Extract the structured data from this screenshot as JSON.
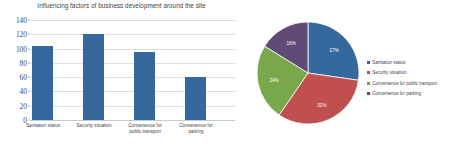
{
  "chart_data": [
    {
      "type": "bar",
      "title": "Influencing factors of business development around the site",
      "xlabel": "",
      "ylabel": "",
      "ylim": [
        0,
        140
      ],
      "yticks": [
        0,
        20,
        40,
        60,
        80,
        100,
        120,
        140
      ],
      "grid": true,
      "legend": "none",
      "categories": [
        "Sanitation status",
        "Security situation",
        "Convenience for public transport",
        "Convenience for parking"
      ],
      "values": [
        103,
        120,
        95,
        60
      ],
      "series_color": "#35699e"
    },
    {
      "type": "pie",
      "title": "",
      "legend": "right",
      "labels": [
        "Sanitation status",
        "Security situation",
        "Convenience for public transport",
        "Convenience for parking"
      ],
      "values": [
        27,
        32,
        24,
        16
      ],
      "value_labels": [
        "27%",
        "32%",
        "24%",
        "16%"
      ],
      "colors": [
        "#35699e",
        "#c0504d",
        "#79a74b",
        "#5f4b76"
      ]
    }
  ],
  "bar_chart": {
    "title": "Influencing factors of business development around the site",
    "yticks": [
      "140",
      "120",
      "100",
      "80",
      "60",
      "40",
      "20",
      "0"
    ],
    "cat0": "Sanitation status",
    "cat1": "Security situation",
    "cat2line1": "Convenience for",
    "cat2line2": "public transport",
    "cat3line1": "Convenience for",
    "cat3line2": "parking"
  },
  "pie_chart": {
    "label0": "27%",
    "label1": "32%",
    "label2": "24%",
    "label3": "16%",
    "legend": [
      "Sanitation status",
      "Security situation",
      "Convenience for public transport",
      "Convenience for parking"
    ]
  }
}
